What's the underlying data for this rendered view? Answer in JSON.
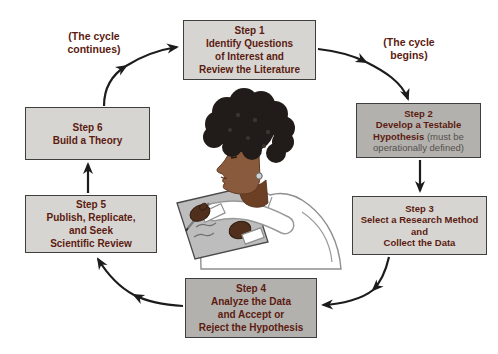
{
  "diagram": {
    "name": "scientific-method-cycle",
    "labels": {
      "cycle_continues": "(The cycle\ncontinues)",
      "cycle_begins": "(The cycle\nbegins)"
    },
    "steps": [
      {
        "id": 1,
        "shade": "light",
        "text": "Step 1\nIdentify Questions\nof Interest and\nReview the Literature"
      },
      {
        "id": 2,
        "shade": "dark",
        "text": "Step 2\nDevelop a Testable\nHypothesis",
        "note": " (must be\noperationally defined)"
      },
      {
        "id": 3,
        "shade": "light",
        "text": "Step 3\nSelect a Research Method\nand\nCollect the Data"
      },
      {
        "id": 4,
        "shade": "dark",
        "text": "Step 4\nAnalyze the Data\nand Accept or\nReject the Hypothesis"
      },
      {
        "id": 5,
        "shade": "light",
        "text": "Step 5\nPublish, Replicate,\nand Seek\nScientific Review"
      },
      {
        "id": 6,
        "shade": "light",
        "text": "Step 6\nBuild a Theory"
      }
    ],
    "illustration": {
      "name": "researcher-writing-notes-illustration",
      "description": "Person with dark curly hair in a white lab coat writing on a gray note pad"
    },
    "colors": {
      "box_light": "#d7d5d2",
      "box_dark": "#b3b1ae",
      "box_border": "#3e3e3e",
      "step_text": "#5c1b10",
      "note_text": "#54504c",
      "arrow": "#1c1c1c",
      "skin": "#8a5a3c",
      "hair": "#211c19",
      "notepad": "#bdbdbd",
      "coat": "#ffffff"
    }
  }
}
